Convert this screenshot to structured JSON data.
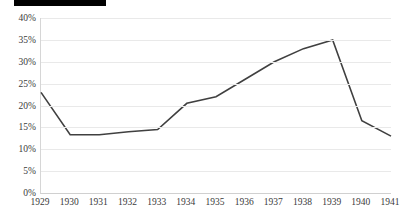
{
  "title": {
    "block_label": "",
    "text": ""
  },
  "chart_data": {
    "type": "line",
    "title": "",
    "xlabel": "",
    "ylabel": "",
    "categories": [
      "1929",
      "1930",
      "1931",
      "1932",
      "1933",
      "1934",
      "1935",
      "1936",
      "1937",
      "1938",
      "1939",
      "1940",
      "1941"
    ],
    "values": [
      23.0,
      13.3,
      13.3,
      14.0,
      14.5,
      20.5,
      22.0,
      26.0,
      30.0,
      33.0,
      35.0,
      16.5,
      13.0
    ],
    "ylim": [
      0,
      40
    ],
    "ytick_values": [
      0,
      5,
      10,
      15,
      20,
      25,
      30,
      35,
      40
    ],
    "ytick_labels": [
      "0%",
      "5%",
      "10%",
      "15%",
      "20%",
      "25%",
      "30%",
      "35%",
      "40%"
    ],
    "grid": true,
    "legend": false,
    "series_color": "#404040",
    "gridline_color": "#e9e9e9",
    "axis_color": "#d0d0d0",
    "tick_label_color": "#3a3a3a"
  }
}
